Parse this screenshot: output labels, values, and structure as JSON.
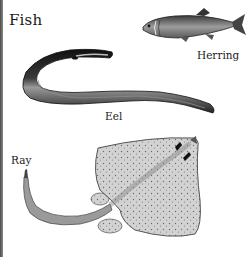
{
  "title": "Fish",
  "specimens": [
    {
      "id": "herring",
      "label": "Herring"
    },
    {
      "id": "eel",
      "label": "Eel"
    },
    {
      "id": "ray",
      "label": "Ray"
    }
  ],
  "colors": {
    "ink": "#1a1a1a",
    "eel_body": "#2b2b2b",
    "herring_body": "#7a7a7a",
    "ray_body": "#c9c9c9",
    "background": "#ffffff"
  }
}
